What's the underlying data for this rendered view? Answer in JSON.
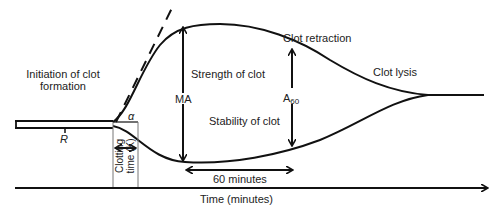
{
  "diagram": {
    "type": "thromboelastography tracing",
    "labels": {
      "initiation": [
        "Initiation of clot",
        "formation"
      ],
      "r": "R",
      "alpha": "α",
      "ma": "MA",
      "strength": "Strength of clot",
      "stability": "Stability of clot",
      "clot_retraction": "Clot retraction",
      "clot_lysis": "Clot lysis",
      "a60_base": "A",
      "a60_sub": "60",
      "clotting_time": [
        "Clotting",
        "time (K)"
      ],
      "sixty_minutes": "60 minutes",
      "time_axis": "Time (minutes)"
    },
    "colors": {
      "line": "#111111",
      "thin": "#777777",
      "text": "#222222"
    }
  }
}
